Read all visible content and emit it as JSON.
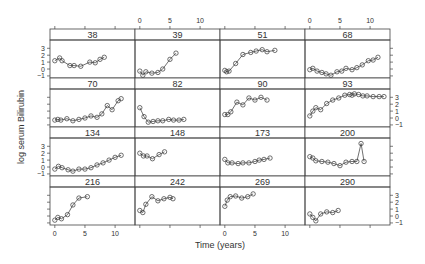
{
  "chart_data": {
    "type": "line",
    "title": "",
    "xlabel": "Time (years)",
    "ylabel": "log serum Bilirubin",
    "xlim": [
      -0.8,
      13.3
    ],
    "ylim": [
      -1.3,
      4.2
    ],
    "xticks": [
      0,
      5,
      10
    ],
    "yticks": [
      -1,
      0,
      1,
      2,
      3
    ],
    "grid": false,
    "legend": null,
    "layout": {
      "rows": 4,
      "cols": 4
    },
    "panels": [
      {
        "id": "38",
        "x": [
          0,
          0.8,
          1.2,
          2.5,
          3.2,
          4.3,
          5.8,
          6.7,
          7.5,
          8.2
        ],
        "y": [
          1.2,
          1.6,
          1.2,
          0.5,
          0.5,
          0.4,
          1.0,
          0.9,
          1.4,
          1.7
        ]
      },
      {
        "id": "39",
        "x": [
          0,
          0.5,
          1,
          2,
          3,
          3.8,
          5,
          6
        ],
        "y": [
          -0.3,
          -0.9,
          -0.4,
          -0.6,
          -0.5,
          0,
          1.4,
          2.3
        ]
      },
      {
        "id": "51",
        "x": [
          0,
          0.3,
          0.7,
          1.8,
          3,
          4.3,
          5.2,
          6.2,
          7,
          8.3
        ],
        "y": [
          -0.2,
          -0.4,
          -0.3,
          0.8,
          2.1,
          2.4,
          2.6,
          2.8,
          2.5,
          2.7
        ]
      },
      {
        "id": "68",
        "x": [
          0,
          0.5,
          1.2,
          2,
          2.7,
          3.5,
          4.5,
          5.3,
          6,
          7,
          7.8,
          8.7,
          9.7,
          10.5,
          11.3
        ],
        "y": [
          -0.1,
          0.1,
          -0.3,
          -0.5,
          -0.7,
          -0.9,
          -0.4,
          -0.3,
          0.1,
          -0.1,
          0.2,
          0.6,
          1.2,
          1.3,
          1.7
        ]
      },
      {
        "id": "70",
        "x": [
          0,
          0.5,
          1,
          2,
          3,
          4,
          5,
          6,
          7,
          7.8,
          8.7,
          9.5,
          10.5,
          11
        ],
        "y": [
          -0.3,
          -0.2,
          -0.3,
          -0.1,
          -0.4,
          -0.2,
          0,
          0.3,
          0.1,
          0.6,
          1.8,
          1.2,
          2.5,
          2.8
        ]
      },
      {
        "id": "82",
        "x": [
          0,
          0.7,
          1.4,
          2.2,
          3,
          3.8,
          4.8,
          5.6,
          6.5,
          7.3
        ],
        "y": [
          1.5,
          0.2,
          -0.6,
          -0.5,
          -0.4,
          -0.4,
          -0.2,
          -0.3,
          -0.3,
          -0.2
        ]
      },
      {
        "id": "90",
        "x": [
          0,
          0.5,
          1,
          2,
          3,
          4,
          5,
          6,
          7
        ],
        "y": [
          0.5,
          0.5,
          0.9,
          2.3,
          1.9,
          2.9,
          2.6,
          3.0,
          2.6
        ]
      },
      {
        "id": "93",
        "x": [
          0,
          0.5,
          1,
          1.8,
          2.8,
          3.8,
          4.8,
          5.8,
          6.6,
          7,
          7.4,
          8.1,
          8.8,
          9.5,
          10.5,
          11.5,
          12.3
        ],
        "y": [
          0.3,
          1.0,
          1.5,
          1.2,
          2.1,
          2.6,
          2.9,
          3.3,
          3.4,
          3.3,
          3.5,
          3.4,
          3.2,
          3.2,
          3.1,
          3.1,
          3.1
        ]
      },
      {
        "id": "134",
        "x": [
          0,
          0.6,
          1.2,
          2.2,
          3,
          4,
          5,
          6,
          7,
          8,
          9,
          10,
          11
        ],
        "y": [
          -0.3,
          0.1,
          -0.1,
          -0.4,
          -0.6,
          -0.3,
          -0.3,
          -0.1,
          0.3,
          0.6,
          1.0,
          1.4,
          1.7
        ]
      },
      {
        "id": "148",
        "x": [
          0,
          0.6,
          1.2,
          2.1,
          3.2,
          4.1
        ],
        "y": [
          2.0,
          1.6,
          1.6,
          1.2,
          1.8,
          2.2
        ]
      },
      {
        "id": "173",
        "x": [
          0,
          0.5,
          1.2,
          2.2,
          3,
          4,
          5,
          5.7,
          6.5,
          7.5
        ],
        "y": [
          1.1,
          0.6,
          0.6,
          0.5,
          0.6,
          0.6,
          0.8,
          1.0,
          1.1,
          1.3
        ]
      },
      {
        "id": "200",
        "x": [
          0,
          0.5,
          1,
          2,
          3,
          4,
          5,
          6,
          7,
          7.8,
          8.5,
          9
        ],
        "y": [
          1.5,
          1.3,
          0.9,
          0.8,
          0.7,
          0.5,
          0.2,
          0.7,
          0.8,
          0.8,
          3.4,
          0.8
        ]
      },
      {
        "id": "216",
        "x": [
          0,
          0.5,
          1.1,
          2.1,
          3,
          4,
          5.4
        ],
        "y": [
          -0.6,
          -0.2,
          -0.4,
          0.2,
          1.6,
          2.6,
          2.8
        ]
      },
      {
        "id": "242",
        "x": [
          0,
          0.5,
          1,
          2,
          3,
          4,
          5,
          5.5
        ],
        "y": [
          0.8,
          0.5,
          1.7,
          2.8,
          2.2,
          2.5,
          2.7,
          2.5
        ]
      },
      {
        "id": "269",
        "x": [
          0,
          0.4,
          0.9,
          1.8,
          2.8,
          3.8,
          4.7
        ],
        "y": [
          1.4,
          2.3,
          2.8,
          2.9,
          2.6,
          2.8,
          3.2
        ]
      },
      {
        "id": "290",
        "x": [
          0,
          0.5,
          1,
          1.8,
          2.8,
          3.8,
          4.7
        ],
        "y": [
          0.3,
          -0.2,
          -0.7,
          0.3,
          0.6,
          0.5,
          0.8
        ]
      }
    ]
  }
}
